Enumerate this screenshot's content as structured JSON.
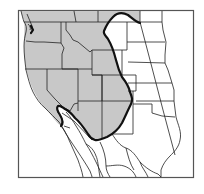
{
  "map": {
    "title": "",
    "region": "Western North America",
    "colors": {
      "background": "#ffffff",
      "range_fill": "#c8c8c8",
      "range_outline": "#111111",
      "borders": "#222222",
      "frame": "#555555"
    },
    "layers": [
      {
        "name": "frame",
        "label": ""
      },
      {
        "name": "shaded-range",
        "label": ""
      },
      {
        "name": "state-borders",
        "label": ""
      },
      {
        "name": "range-boundary",
        "label": ""
      }
    ],
    "labels": []
  }
}
